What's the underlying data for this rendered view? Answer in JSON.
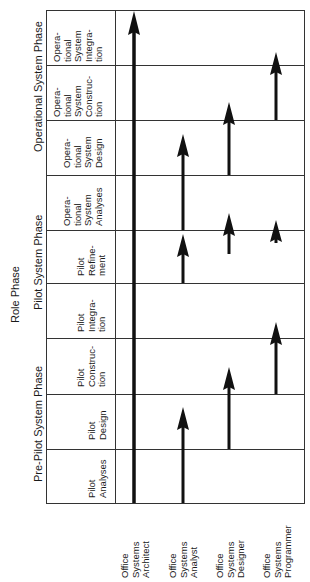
{
  "diagram": {
    "title": "Role Phase",
    "phase_groups": [
      {
        "label": "Operational System Phase"
      },
      {
        "label": "Pilot System Phase"
      },
      {
        "label": "Pre-Pilot System Phase"
      }
    ],
    "stages": [
      {
        "label": "Opera-\ntional\nSystem\nIntegra-\ntion"
      },
      {
        "label": "Opera-\ntional\nSystem\nConstruc-\ntion"
      },
      {
        "label": "Opera-\ntional\nSystem\nDesign"
      },
      {
        "label": "Opera-\ntional\nSystem\nAnalyses"
      },
      {
        "label": "Pilot\nRefine-\nment"
      },
      {
        "label": "Pilot\nIntegra-\ntion"
      },
      {
        "label": "Pilot\nConstruc-\ntion"
      },
      {
        "label": "Pilot\nDesign"
      },
      {
        "label": "Pilot\nAnalyses"
      }
    ],
    "roles": [
      {
        "label": "Office\nSystems\nArchitect"
      },
      {
        "label": "Office\nSystems\nAnalyst"
      },
      {
        "label": "Office\nSystems\nDesigner"
      },
      {
        "label": "Office\nSystems\nProgrammer"
      }
    ],
    "colors": {
      "line": "#333333",
      "arrow": "#111111",
      "background": "#ffffff"
    }
  }
}
